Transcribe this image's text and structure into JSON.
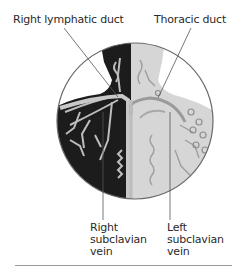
{
  "diagram": {
    "labels": {
      "top_left": "Right lymphatic duct",
      "top_right": "Thoracic duct",
      "bottom_left": [
        "Right",
        "subclavian",
        "vein"
      ],
      "bottom_right": [
        "Left",
        "subclavian",
        "vein"
      ]
    },
    "colors": {
      "dark_side": "#1c1c1c",
      "light_side": "#d6d6d6",
      "vessel_light": "#bdbdbd",
      "vessel_dark": "#8e8e8e",
      "leader_line": "#555555",
      "circle_outline": "#6a6a6a",
      "rule": "#9a9a9a"
    }
  }
}
